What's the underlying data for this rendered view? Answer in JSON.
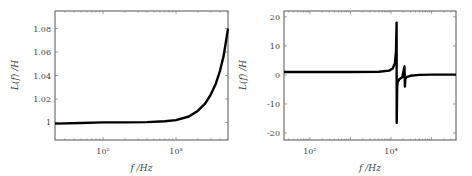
{
  "chart_data": [
    {
      "type": "line",
      "xscale": "log",
      "xlabel": "f /Hz",
      "ylabel": "L(f) /H",
      "xlim": [
        22,
        5150
      ],
      "ylim": [
        0.985,
        1.095
      ],
      "xticks": [
        {
          "value": 100,
          "label": "10²"
        },
        {
          "value": 1000,
          "label": "10³"
        }
      ],
      "yticks": [
        {
          "value": 1,
          "label": "1"
        },
        {
          "value": 1.02,
          "label": "1.02"
        },
        {
          "value": 1.04,
          "label": "1.04"
        },
        {
          "value": 1.06,
          "label": "1.06"
        },
        {
          "value": 1.08,
          "label": "1.08"
        }
      ],
      "grid": false,
      "series": [
        {
          "name": "L(f)",
          "x": [
            22,
            50,
            100,
            200,
            400,
            700,
            1000,
            1500,
            2000,
            2500,
            3000,
            3500,
            4000,
            4500,
            5150
          ],
          "y": [
            0.999,
            0.9995,
            1.0,
            1.0,
            1.0003,
            1.001,
            1.002,
            1.005,
            1.01,
            1.016,
            1.024,
            1.033,
            1.044,
            1.057,
            1.08
          ]
        }
      ]
    },
    {
      "type": "line",
      "xscale": "log",
      "xlabel": "f /Hz",
      "ylabel": "L(f) /H",
      "xlim": [
        23,
        400000
      ],
      "ylim": [
        -22.4,
        22
      ],
      "xticks": [
        {
          "value": 100,
          "label": "10²"
        },
        {
          "value": 10000,
          "label": "10⁴"
        }
      ],
      "yticks": [
        {
          "value": -20,
          "label": "-20"
        },
        {
          "value": -10,
          "label": "-10"
        },
        {
          "value": 0,
          "label": "0"
        },
        {
          "value": 10,
          "label": "10"
        },
        {
          "value": 20,
          "label": "20"
        }
      ],
      "grid": false,
      "series": [
        {
          "name": "L(f)",
          "x": [
            23,
            1000,
            5000,
            9000,
            11000,
            12500,
            13300,
            13700,
            13800,
            14200,
            14600,
            16000,
            19000,
            21500,
            22000,
            22500,
            24000,
            30000,
            50000,
            100000,
            400000
          ],
          "y": [
            1.0,
            1.0,
            1.1,
            1.5,
            2.2,
            4,
            8,
            18,
            -16.5,
            -4,
            -2.5,
            -1.5,
            -0.8,
            3,
            -4,
            -1.5,
            -0.8,
            -0.3,
            0.0,
            0.1,
            0.1
          ]
        }
      ]
    }
  ]
}
